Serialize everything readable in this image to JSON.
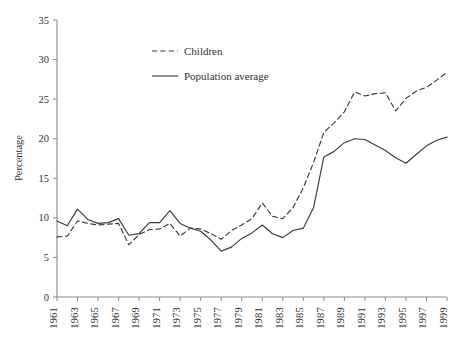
{
  "chart_data": {
    "type": "line",
    "title": "",
    "subtitle": "",
    "xlabel": "",
    "ylabel": "Percentage",
    "ylim": [
      0,
      35
    ],
    "xlim": [
      1961,
      1999
    ],
    "yticks": [
      "0",
      "5",
      "10",
      "15",
      "20",
      "25",
      "30",
      "35"
    ],
    "ytick_values": [
      0,
      5,
      10,
      15,
      20,
      25,
      30,
      35
    ],
    "xticks": [
      "1961",
      "1963",
      "1965",
      "1967",
      "1969",
      "1971",
      "1973",
      "1975",
      "1977",
      "1979",
      "1981",
      "1983",
      "1985",
      "1987",
      "1989",
      "1991",
      "1993",
      "1995",
      "1997",
      "1999"
    ],
    "xtick_values": [
      1961,
      1963,
      1965,
      1967,
      1969,
      1971,
      1973,
      1975,
      1977,
      1979,
      1981,
      1983,
      1985,
      1987,
      1989,
      1991,
      1993,
      1995,
      1997,
      1999
    ],
    "xtick_rotation": 90,
    "grid": false,
    "legend_position": "upper-left-inside",
    "x": [
      1961,
      1962,
      1963,
      1964,
      1965,
      1966,
      1967,
      1968,
      1969,
      1970,
      1971,
      1972,
      1973,
      1974,
      1975,
      1976,
      1977,
      1978,
      1979,
      1980,
      1981,
      1982,
      1983,
      1984,
      1985,
      1986,
      1987,
      1988,
      1989,
      1990,
      1991,
      1992,
      1993,
      1994,
      1995,
      1996,
      1997,
      1998,
      1999
    ],
    "series": [
      {
        "name": "Children",
        "style": "dashed",
        "color": "#3a3a3a",
        "values": [
          7.6,
          7.7,
          9.6,
          9.3,
          9.1,
          9.2,
          9.3,
          6.6,
          7.9,
          8.5,
          8.6,
          9.3,
          7.7,
          8.7,
          8.6,
          8.0,
          7.3,
          8.4,
          9.1,
          9.9,
          11.9,
          10.2,
          9.9,
          11.3,
          13.8,
          17.0,
          20.8,
          22.0,
          23.4,
          25.9,
          25.4,
          25.7,
          25.8,
          23.5,
          25.1,
          26.0,
          26.5,
          27.4,
          28.4
        ]
      },
      {
        "name": "Population average",
        "style": "solid",
        "color": "#3a3a3a",
        "values": [
          9.6,
          9.0,
          11.1,
          9.8,
          9.3,
          9.4,
          9.9,
          7.8,
          8.0,
          9.4,
          9.4,
          10.9,
          9.3,
          8.7,
          8.3,
          7.2,
          5.8,
          6.3,
          7.4,
          8.1,
          9.1,
          8.0,
          7.5,
          8.4,
          8.7,
          11.3,
          17.7,
          18.4,
          19.5,
          20.0,
          19.9,
          19.2,
          18.5,
          17.6,
          16.9,
          18.0,
          19.1,
          19.8,
          20.2
        ]
      }
    ],
    "legend": [
      {
        "label": "Children",
        "style": "dashed"
      },
      {
        "label": "Population average",
        "style": "solid"
      }
    ]
  },
  "plot": {
    "left": 57,
    "right": 447,
    "top": 20,
    "bottom": 297
  }
}
